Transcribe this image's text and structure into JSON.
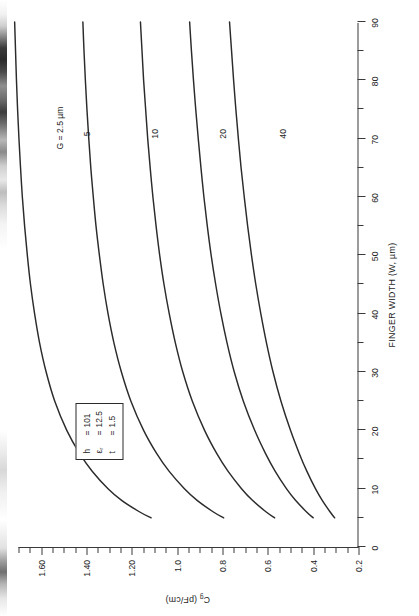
{
  "chart_data": {
    "type": "line",
    "title": "",
    "xlabel": "FINGER WIDTH (W, µm)",
    "ylabel": "C₉ (pF/cm)",
    "xlim": [
      0,
      90
    ],
    "ylim": [
      0.2,
      1.7
    ],
    "grid": false,
    "legend_position": "inline-curve-labels",
    "x_ticks_major": [
      0,
      10,
      20,
      30,
      40,
      50,
      60,
      70,
      80,
      90
    ],
    "x_tick_labels": [
      "0",
      "10",
      "20",
      "30",
      "40",
      "50",
      "60",
      "70",
      "80",
      "90"
    ],
    "x_tick_minor_step": 5,
    "y_ticks_major": [
      0.2,
      0.4,
      0.6,
      0.8,
      1.0,
      1.2,
      1.4,
      1.6
    ],
    "y_tick_labels": [
      "0.2",
      "0.4",
      "0.6",
      "0.8",
      "1.0",
      "1.20",
      "1.40",
      "1.60"
    ],
    "y_tick_minor_step": 0.05,
    "series": [
      {
        "name": "G = 2.5 µm",
        "label": "G = 2.5 µm",
        "label_x": 72,
        "label_y": 1.52,
        "x": [
          5,
          6,
          8,
          10,
          13,
          16,
          20,
          25,
          30,
          35,
          40,
          45,
          50,
          55,
          60,
          65,
          70,
          75,
          80,
          85,
          90
        ],
        "y": [
          1.115,
          1.165,
          1.245,
          1.305,
          1.375,
          1.43,
          1.487,
          1.54,
          1.578,
          1.607,
          1.629,
          1.647,
          1.661,
          1.673,
          1.683,
          1.691,
          1.698,
          1.704,
          1.709,
          1.713,
          1.717
        ]
      },
      {
        "name": "G = 5 µm",
        "label": "5",
        "label_x": 71,
        "label_y": 1.4,
        "x": [
          5,
          6,
          8,
          10,
          13,
          16,
          20,
          25,
          30,
          35,
          40,
          45,
          50,
          55,
          60,
          65,
          70,
          75,
          80,
          85,
          90
        ],
        "y": [
          0.795,
          0.84,
          0.912,
          0.968,
          1.036,
          1.09,
          1.148,
          1.204,
          1.246,
          1.279,
          1.305,
          1.326,
          1.343,
          1.358,
          1.37,
          1.381,
          1.39,
          1.398,
          1.405,
          1.411,
          1.416
        ]
      },
      {
        "name": "G = 10 µm",
        "label": "10",
        "label_x": 71,
        "label_y": 1.1,
        "x": [
          5,
          6,
          8,
          10,
          13,
          16,
          20,
          25,
          30,
          35,
          40,
          45,
          50,
          55,
          60,
          65,
          70,
          75,
          80,
          85,
          90
        ],
        "y": [
          0.57,
          0.607,
          0.668,
          0.716,
          0.776,
          0.825,
          0.879,
          0.933,
          0.975,
          1.008,
          1.035,
          1.058,
          1.077,
          1.093,
          1.107,
          1.119,
          1.13,
          1.139,
          1.148,
          1.155,
          1.162
        ]
      },
      {
        "name": "G = 20 µm",
        "label": "20",
        "label_x": 71,
        "label_y": 0.8,
        "x": [
          5,
          6,
          8,
          10,
          13,
          16,
          20,
          25,
          30,
          35,
          40,
          45,
          50,
          55,
          60,
          65,
          70,
          75,
          80,
          85,
          90
        ],
        "y": [
          0.4,
          0.429,
          0.478,
          0.518,
          0.568,
          0.61,
          0.658,
          0.708,
          0.748,
          0.78,
          0.807,
          0.83,
          0.85,
          0.867,
          0.882,
          0.895,
          0.907,
          0.918,
          0.928,
          0.937,
          0.945
        ]
      },
      {
        "name": "G = 40 µm",
        "label": "40",
        "label_x": 71,
        "label_y": 0.535,
        "x": [
          5,
          6,
          8,
          10,
          13,
          16,
          20,
          25,
          30,
          35,
          40,
          45,
          50,
          55,
          60,
          65,
          70,
          75,
          80,
          85,
          90
        ],
        "y": [
          0.305,
          0.325,
          0.36,
          0.39,
          0.428,
          0.461,
          0.5,
          0.542,
          0.577,
          0.606,
          0.631,
          0.653,
          0.672,
          0.689,
          0.704,
          0.718,
          0.73,
          0.741,
          0.751,
          0.76,
          0.769
        ]
      }
    ],
    "annotations": {
      "parameter_box": {
        "rows": [
          {
            "symbol": "h",
            "equals": "=",
            "value": "101"
          },
          {
            "symbol": "ε",
            "sub": "r",
            "equals": "=",
            "value": "12.5"
          },
          {
            "symbol": "t",
            "equals": "=",
            "value": "1.5"
          }
        ],
        "x": 15,
        "y": 1.45
      }
    }
  },
  "style": {
    "curve_color": "#2b2b2b",
    "axis_color": "#3a3a3a",
    "text_color": "#1d1d1d",
    "background": "#ffffff"
  }
}
